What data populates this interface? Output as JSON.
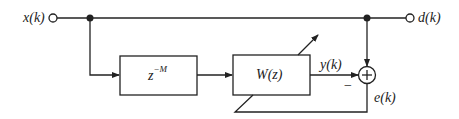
{
  "diagram": {
    "type": "adaptive line enhancer block diagram",
    "nodes": {
      "input": {
        "label": "x(k)"
      },
      "desired": {
        "label": "d(k)"
      },
      "delay": {
        "label_base": "z",
        "label_exp": "−M"
      },
      "filter": {
        "label": "W(z)"
      },
      "output": {
        "label": "y(k)"
      },
      "error": {
        "label": "e(k)"
      },
      "sum": {
        "symbol": "+",
        "minus_sign": "−"
      }
    },
    "edges": [
      {
        "from": "input",
        "to": "desired",
        "note": "top line"
      },
      {
        "from": "input",
        "to": "delay"
      },
      {
        "from": "delay",
        "to": "filter"
      },
      {
        "from": "filter",
        "to": "sum",
        "label": "y(k)",
        "sign": "−"
      },
      {
        "from": "desired",
        "to": "sum",
        "sign": "+"
      },
      {
        "from": "sum",
        "to": "filter",
        "label": "e(k)",
        "note": "adaptation feedback"
      }
    ],
    "colors": {
      "stroke": "#222222",
      "background": "#ffffff"
    }
  }
}
